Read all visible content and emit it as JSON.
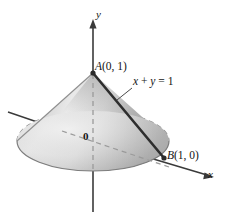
{
  "figure": {
    "kind": "cone-solid-3d-diagram",
    "background_color": "#ffffff",
    "labels": {
      "point_a": "A (0, 1)",
      "point_a_name": "A",
      "point_a_coords": "(0, 1)",
      "point_b": "B (1, 0)",
      "point_b_name": "B",
      "point_b_coords": "(1, 0)",
      "origin": "0",
      "axis_y": "y",
      "axis_x": "x",
      "equation": "x + y = 1",
      "equation_lhs_x": "x",
      "equation_plus": "+",
      "equation_lhs_y": "y",
      "equation_eq": "=",
      "equation_rhs": "1"
    },
    "colors": {
      "axis": "#3a3a3a",
      "outline": "#6e6e6e",
      "dashed": "#8a8a8a",
      "slant_line": "#2e2e2e",
      "cone_light": "#e7e7e7",
      "cone_mid": "#cfcfcf",
      "cone_dark": "#aeaeae",
      "base_light": "#e3e3e3",
      "base_dark": "#b4b4b4",
      "text": "#141414"
    },
    "geometry": {
      "apex_x": 93,
      "apex_y": 73,
      "base_center_x": 93,
      "base_center_y": 141,
      "base_radius_x": 76,
      "base_radius_y": 30,
      "point_b_x": 164,
      "point_b_y": 158
    }
  }
}
